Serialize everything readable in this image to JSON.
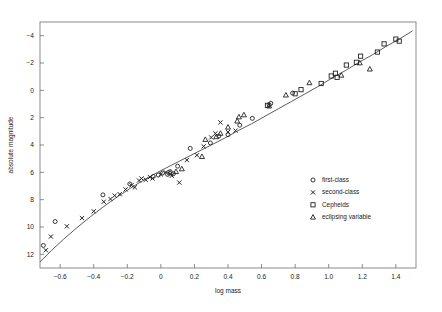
{
  "chart_data": {
    "type": "scatter",
    "title": "",
    "xlabel": "log mass",
    "ylabel": "absolute magnitude",
    "xlim": [
      -0.72,
      1.52
    ],
    "ylim": [
      -5.0,
      13.0
    ],
    "y_inverted": true,
    "grid": false,
    "legend_position": "lower-right-inside",
    "xticks": [
      -0.6,
      -0.4,
      -0.2,
      0,
      0.2,
      0.4,
      0.6,
      0.8,
      1.0,
      1.2,
      1.4
    ],
    "xtick_labels": [
      "−0.6",
      "−0.4",
      "−0.2",
      "0",
      "0.2",
      "0.4",
      "0.6",
      "0.8",
      "1.0",
      "1.2",
      "1.4"
    ],
    "yticks": [
      -4,
      -2,
      0,
      2,
      4,
      6,
      8,
      10,
      12
    ],
    "ytick_labels": [
      "−4",
      "−2",
      "0",
      "2",
      "4",
      "6",
      "8",
      "10",
      "12"
    ],
    "series": [
      {
        "name": "first-class",
        "marker": "circle",
        "color": "#222222",
        "points": [
          [
            -0.7,
            11.35
          ],
          [
            -0.63,
            9.6
          ],
          [
            -0.345,
            7.65
          ],
          [
            -0.185,
            6.85
          ],
          [
            -0.045,
            6.3
          ],
          [
            -0.015,
            6.2
          ],
          [
            0.01,
            6.05
          ],
          [
            0.04,
            6.15
          ],
          [
            0.055,
            5.95
          ],
          [
            0.075,
            6.1
          ],
          [
            0.1,
            5.55
          ],
          [
            0.175,
            4.25
          ],
          [
            0.295,
            3.85
          ],
          [
            0.345,
            3.35
          ],
          [
            0.4,
            3.25
          ],
          [
            0.47,
            2.55
          ],
          [
            0.545,
            2.05
          ],
          [
            0.645,
            1.05
          ],
          [
            0.655,
            0.95
          ],
          [
            0.785,
            0.2
          ]
        ]
      },
      {
        "name": "second-class",
        "marker": "cross",
        "color": "#222222",
        "points": [
          [
            -0.685,
            11.7
          ],
          [
            -0.655,
            10.7
          ],
          [
            -0.56,
            9.95
          ],
          [
            -0.47,
            9.35
          ],
          [
            -0.4,
            8.85
          ],
          [
            -0.34,
            8.15
          ],
          [
            -0.3,
            7.95
          ],
          [
            -0.275,
            7.7
          ],
          [
            -0.245,
            7.6
          ],
          [
            -0.21,
            7.25
          ],
          [
            -0.175,
            6.95
          ],
          [
            -0.155,
            7.1
          ],
          [
            -0.13,
            6.6
          ],
          [
            -0.115,
            6.45
          ],
          [
            -0.09,
            6.55
          ],
          [
            -0.065,
            6.35
          ],
          [
            -0.05,
            6.45
          ],
          [
            0.0,
            6.15
          ],
          [
            0.03,
            6.0
          ],
          [
            0.065,
            6.25
          ],
          [
            0.11,
            6.75
          ],
          [
            0.155,
            5.1
          ],
          [
            0.215,
            4.75
          ],
          [
            0.255,
            4.1
          ],
          [
            0.3,
            3.45
          ],
          [
            0.325,
            3.15
          ],
          [
            0.355,
            2.35
          ],
          [
            0.4,
            3.05
          ],
          [
            0.445,
            2.95
          ]
        ]
      },
      {
        "name": "Cepheids",
        "marker": "square",
        "color": "#222222",
        "points": [
          [
            0.635,
            1.1
          ],
          [
            0.8,
            0.25
          ],
          [
            0.835,
            -0.05
          ],
          [
            0.955,
            -0.5
          ],
          [
            1.015,
            -1.05
          ],
          [
            1.04,
            -1.25
          ],
          [
            1.05,
            -0.95
          ],
          [
            1.105,
            -1.85
          ],
          [
            1.165,
            -2.05
          ],
          [
            1.19,
            -2.5
          ],
          [
            1.29,
            -2.8
          ],
          [
            1.33,
            -3.4
          ],
          [
            1.4,
            -3.75
          ],
          [
            1.42,
            -3.6
          ]
        ]
      },
      {
        "name": "eclipsing variable",
        "marker": "triangle",
        "color": "#222222",
        "points": [
          [
            0.055,
            6.05
          ],
          [
            0.09,
            5.95
          ],
          [
            0.125,
            5.75
          ],
          [
            0.245,
            4.85
          ],
          [
            0.265,
            3.6
          ],
          [
            0.33,
            3.4
          ],
          [
            0.355,
            3.15
          ],
          [
            0.4,
            2.7
          ],
          [
            0.455,
            2.25
          ],
          [
            0.465,
            1.95
          ],
          [
            0.495,
            1.8
          ],
          [
            0.645,
            1.15
          ],
          [
            0.745,
            0.35
          ],
          [
            0.885,
            -0.55
          ],
          [
            1.075,
            -1.1
          ],
          [
            1.185,
            -2.0
          ],
          [
            1.245,
            -1.55
          ]
        ]
      }
    ],
    "fit_curve": {
      "name": "mass-luminosity fit",
      "color": "#4a4a4a",
      "points": [
        [
          -0.72,
          12.55
        ],
        [
          -0.65,
          11.7
        ],
        [
          -0.58,
          10.9
        ],
        [
          -0.5,
          10.05
        ],
        [
          -0.42,
          9.25
        ],
        [
          -0.34,
          8.5
        ],
        [
          -0.26,
          7.8
        ],
        [
          -0.18,
          7.15
        ],
        [
          -0.1,
          6.55
        ],
        [
          -0.02,
          6.0
        ],
        [
          0.06,
          5.5
        ],
        [
          0.14,
          5.0
        ],
        [
          0.22,
          4.5
        ],
        [
          0.3,
          4.0
        ],
        [
          0.38,
          3.5
        ],
        [
          0.46,
          2.95
        ],
        [
          0.54,
          2.45
        ],
        [
          0.62,
          1.9
        ],
        [
          0.7,
          1.35
        ],
        [
          0.78,
          0.8
        ],
        [
          0.86,
          0.25
        ],
        [
          0.94,
          -0.3
        ],
        [
          1.02,
          -0.9
        ],
        [
          1.1,
          -1.45
        ],
        [
          1.18,
          -2.05
        ],
        [
          1.26,
          -2.6
        ],
        [
          1.34,
          -3.2
        ],
        [
          1.42,
          -3.75
        ],
        [
          1.5,
          -4.35
        ]
      ]
    },
    "legend_entries": [
      {
        "label": "first-class",
        "marker": "circle"
      },
      {
        "label": "second-class",
        "marker": "cross"
      },
      {
        "label": "Cepheids",
        "marker": "square"
      },
      {
        "label": "eclipsing variable",
        "marker": "triangle"
      }
    ]
  }
}
